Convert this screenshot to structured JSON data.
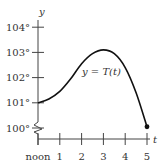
{
  "chart_data": {
    "type": "line",
    "title": "",
    "xlabel": "t",
    "ylabel": "y",
    "curve_label": "y = T(t)",
    "x_tick_labels": [
      "noon",
      "1",
      "2",
      "3",
      "4",
      "5"
    ],
    "x_ticks": [
      0,
      1,
      2,
      3,
      4,
      5
    ],
    "y_tick_labels": [
      "100°",
      "101°",
      "102°",
      "103°",
      "104°"
    ],
    "y_ticks": [
      100,
      101,
      102,
      103,
      104
    ],
    "xlim": [
      0,
      5
    ],
    "ylim": [
      100,
      104
    ],
    "axis_break": true,
    "grid": false,
    "series": [
      {
        "name": "T(t)",
        "x": [
          0,
          0.5,
          1,
          1.5,
          2,
          2.5,
          3,
          3.5,
          4,
          4.5,
          5
        ],
        "values": [
          101.0,
          101.15,
          101.45,
          101.95,
          102.55,
          102.95,
          103.1,
          102.95,
          102.4,
          101.4,
          100.05
        ],
        "end_marker": true
      }
    ],
    "color": "#111111"
  }
}
